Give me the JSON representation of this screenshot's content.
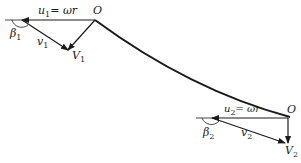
{
  "diagram": {
    "inlet": {
      "origin_label": "O",
      "u_label": "u",
      "u_sub": "1",
      "u_expr": "= ωr",
      "v_label": "v",
      "v_sub": "1",
      "V_label": "V",
      "V_sub": "1",
      "beta_label": "β",
      "beta_sub": "1"
    },
    "outlet": {
      "origin_label": "O",
      "u_label": "u",
      "u_sub": "2",
      "u_expr": "= ωr",
      "v_label": "v",
      "v_sub": "2",
      "V_label": "V",
      "V_sub": "2",
      "beta_label": "β",
      "beta_sub": "2"
    },
    "colors": {
      "ink": "#1a1a1a",
      "background": "#ffffff"
    }
  }
}
